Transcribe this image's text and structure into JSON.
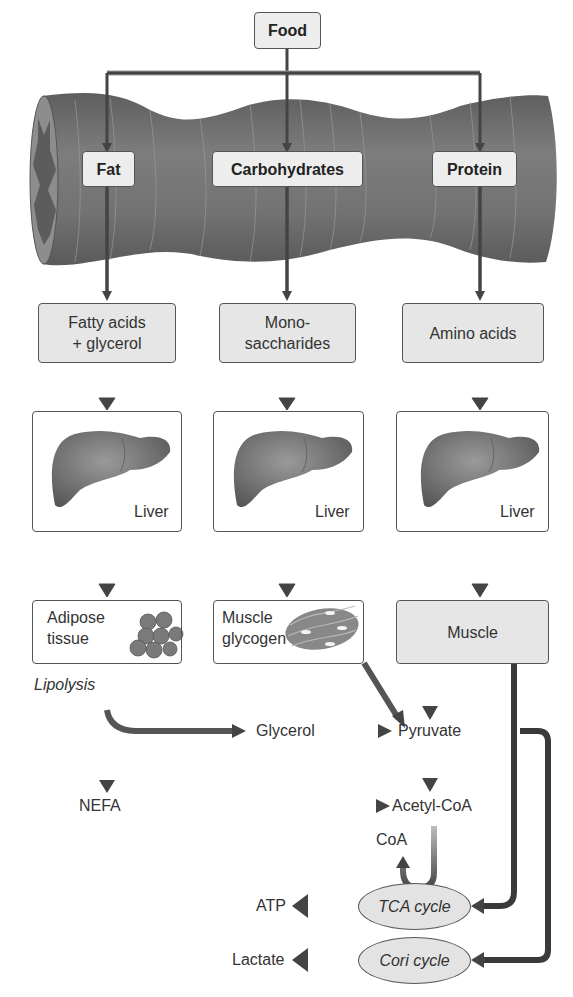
{
  "diagram": {
    "top": {
      "food": "Food"
    },
    "nutrients": {
      "fat": "Fat",
      "carbohydrates": "Carbohydrates",
      "protein": "Protein"
    },
    "absorbed": {
      "fatty_acids_line1": "Fatty acids",
      "fatty_acids_line2": "+ glycerol",
      "mono_line1": "Mono-",
      "mono_line2": "saccharides",
      "amino": "Amino acids"
    },
    "liver": {
      "label": "Liver"
    },
    "tissues": {
      "adipose_line1": "Adipose",
      "adipose_line2": "tissue",
      "glycogen_line1": "Muscle",
      "glycogen_line2": "glycogen",
      "muscle": "Muscle"
    },
    "metabolites": {
      "lipolysis": "Lipolysis",
      "glycerol": "Glycerol",
      "pyruvate": "Pyruvate",
      "nefa": "NEFA",
      "acetyl_coa": "Acetyl-CoA",
      "coa": "CoA",
      "atp": "ATP",
      "lactate": "Lactate"
    },
    "cycles": {
      "tca": "TCA cycle",
      "cori": "Cori cycle"
    },
    "colors": {
      "arrow": "#444444",
      "box_fill": "#e6e6e6",
      "intestine": "#6e6e6e",
      "border": "#555555"
    }
  }
}
